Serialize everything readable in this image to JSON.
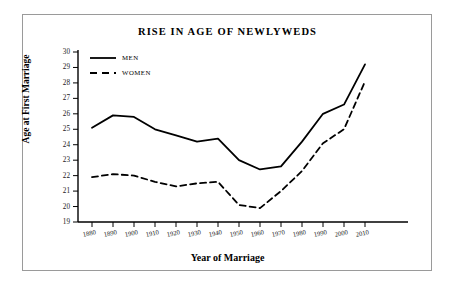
{
  "chart_data": {
    "type": "line",
    "title": "RISE IN AGE OF NEWLYWEDS",
    "xlabel": "Year of Marriage",
    "ylabel": "Age at First Marriage",
    "categories": [
      "1880",
      "1890",
      "1900",
      "1910",
      "1920",
      "1930",
      "1940",
      "1950",
      "1960",
      "1970",
      "1980",
      "1990",
      "2000",
      "2010"
    ],
    "x": [
      1880,
      1890,
      1900,
      1910,
      1920,
      1930,
      1940,
      1950,
      1960,
      1970,
      1980,
      1990,
      2000,
      2010
    ],
    "series": [
      {
        "name": "MEN",
        "style": "solid",
        "color": "#000000",
        "values": [
          25.1,
          25.9,
          25.8,
          25.0,
          24.6,
          24.2,
          24.4,
          23.0,
          22.4,
          22.6,
          24.2,
          26.0,
          26.6,
          29.2
        ]
      },
      {
        "name": "WOMEN",
        "style": "dashed",
        "color": "#000000",
        "values": [
          21.9,
          22.1,
          22.0,
          21.6,
          21.3,
          21.5,
          21.6,
          20.1,
          19.9,
          21.0,
          22.3,
          24.1,
          25.0,
          28.1
        ]
      }
    ],
    "ylim": [
      19,
      30
    ],
    "yticks": [
      "19",
      "20",
      "21",
      "22",
      "23",
      "24",
      "25",
      "26",
      "27",
      "28",
      "29",
      "30"
    ],
    "grid": false,
    "legend_position": "top-left-inside"
  },
  "legend": {
    "items": [
      {
        "label": "MEN",
        "style": "solid"
      },
      {
        "label": "WOMEN",
        "style": "dashed"
      }
    ]
  },
  "colors": {
    "line": "#000000",
    "axis": "#000000",
    "frame_border": "#9a9a9a",
    "background": "#ffffff"
  }
}
